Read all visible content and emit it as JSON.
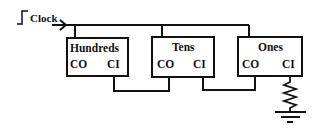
{
  "diagram": {
    "clock": {
      "label": "Clock",
      "icon": "clock-pulse-icon"
    },
    "counters": [
      {
        "name": "Hundreds",
        "co_label": "CO",
        "ci_label": "CI"
      },
      {
        "name": "Tens",
        "co_label": "CO",
        "ci_label": "CI"
      },
      {
        "name": "Ones",
        "co_label": "CO",
        "ci_label": "CI"
      }
    ],
    "termination": {
      "resistor": "resistor-icon",
      "ground": "ground-icon"
    },
    "colors": {
      "line": "#111111",
      "background": "#ffffff"
    }
  }
}
